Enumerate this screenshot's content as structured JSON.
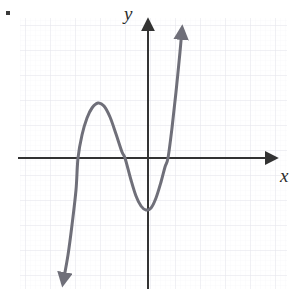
{
  "figure": {
    "bullet_marker": "•",
    "background_color": "#ffffff"
  },
  "axes": {
    "x_label": "x",
    "y_label": "y",
    "axis_color": "#333333",
    "origin_px": [
      148,
      158
    ],
    "x_axis_extent_px": [
      18,
      278
    ],
    "y_axis_extent_px": [
      18,
      288
    ],
    "arrowheads": [
      "x-positive",
      "y-positive"
    ]
  },
  "grid": {
    "visible": true,
    "color": "#e8e8ee",
    "minor_color": "#f3f3f7",
    "spacing_px": 25,
    "left_px": 20,
    "top_px": 18,
    "right_px": 287,
    "bottom_px": 289
  },
  "chart_data": {
    "type": "line",
    "xlabel": "x",
    "ylabel": "y",
    "grid": true,
    "legend": false,
    "curve_color": "#6f6f79",
    "units_per_gridline": 1,
    "xlim": [
      -5.2,
      5.2
    ],
    "ylim": [
      -5.2,
      5.6
    ],
    "series": [
      {
        "name": "cubic",
        "shape": "cubic",
        "end_arrows": [
          "down-left",
          "up-right"
        ],
        "x_intercepts": [
          -2.8,
          -0.9,
          0.8
        ],
        "local_maximum": [
          -2.0,
          2.2
        ],
        "local_minimum": [
          -0.1,
          -2.1
        ],
        "start_point_px": [
          63,
          283
        ],
        "end_point_px": [
          182,
          29
        ],
        "points_px": [
          [
            63,
            283
          ],
          [
            68,
            255
          ],
          [
            72,
            225
          ],
          [
            76,
            190
          ],
          [
            78,
            158
          ],
          [
            82,
            135
          ],
          [
            87,
            118
          ],
          [
            92,
            108
          ],
          [
            98,
            103
          ],
          [
            104,
            106
          ],
          [
            110,
            117
          ],
          [
            116,
            134
          ],
          [
            122,
            152
          ],
          [
            125,
            158
          ],
          [
            131,
            180
          ],
          [
            136,
            196
          ],
          [
            141,
            206
          ],
          [
            146,
            210
          ],
          [
            151,
            208
          ],
          [
            156,
            198
          ],
          [
            161,
            182
          ],
          [
            165,
            167
          ],
          [
            168,
            158
          ],
          [
            172,
            128
          ],
          [
            176,
            92
          ],
          [
            180,
            52
          ],
          [
            182,
            29
          ]
        ]
      }
    ]
  }
}
